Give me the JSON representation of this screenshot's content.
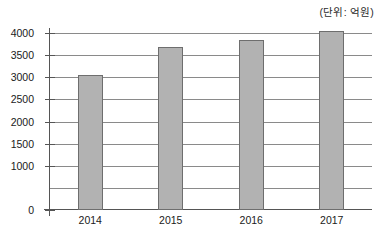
{
  "chart_data": {
    "type": "bar",
    "title": "",
    "subtitle": "",
    "unit_note": "(단위: 억원)",
    "xlabel": "",
    "ylabel": "",
    "categories": [
      "2014",
      "2015",
      "2016",
      "2017"
    ],
    "values": [
      3060,
      3680,
      3840,
      4040
    ],
    "series": [
      {
        "name": "금액",
        "values": [
          3060,
          3680,
          3840,
          4040
        ]
      }
    ],
    "ylim": [
      0,
      4000
    ],
    "ytick_values": [
      0,
      1000,
      1500,
      2000,
      2500,
      3000,
      3500,
      4000
    ],
    "ytick_labels": [
      "0",
      "1000",
      "1500",
      "2000",
      "2500",
      "3000",
      "3500",
      "4000"
    ],
    "gridline_values": [
      500,
      1000,
      1500,
      2000,
      2500,
      3000,
      3500,
      4000
    ],
    "grid": true,
    "grid_axis": "y",
    "legend": false,
    "legend_position": "none",
    "bar_fill_color": "#b2b2b2",
    "bar_border_color": "#6e6e6e",
    "axis_color": "#555555",
    "gridline_color": "#8a8a8a",
    "background_color": "#ffffff"
  }
}
